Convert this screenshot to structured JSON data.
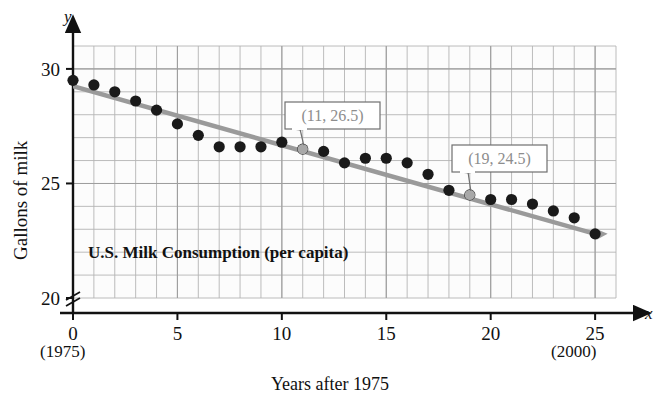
{
  "chart_data": {
    "type": "scatter",
    "title": "U.S. Milk Consumption (per capita)",
    "xlabel": "Years after 1975",
    "ylabel": "Gallons of milk",
    "xlim": [
      0,
      26
    ],
    "ylim": [
      20,
      31
    ],
    "grid": true,
    "y_axis_break": true,
    "legend": "none",
    "x_ticks": [
      "0",
      "5",
      "10",
      "15",
      "20",
      "25"
    ],
    "x_tick_values": [
      0,
      5,
      10,
      15,
      20,
      25
    ],
    "y_ticks": [
      "20",
      "25",
      "30"
    ],
    "y_tick_values": [
      20,
      25,
      30
    ],
    "x_axis_var": "x",
    "y_axis_var": "y",
    "x_start_year_label": "(1975)",
    "x_end_year_label": "(2000)",
    "x": [
      0,
      1,
      2,
      3,
      4,
      5,
      6,
      7,
      8,
      9,
      10,
      11,
      12,
      13,
      14,
      15,
      16,
      17,
      18,
      19,
      20,
      21,
      22,
      23,
      24,
      25
    ],
    "values": [
      29.5,
      29.3,
      29.0,
      28.6,
      28.2,
      27.6,
      27.1,
      26.6,
      26.6,
      26.6,
      26.8,
      26.5,
      26.4,
      25.9,
      26.1,
      26.1,
      25.9,
      25.4,
      24.7,
      24.5,
      24.3,
      24.3,
      24.1,
      23.8,
      23.5,
      22.8
    ],
    "series": [
      {
        "name": "U.S. milk consumption per capita (gallons)",
        "values": [
          29.5,
          29.3,
          29.0,
          28.6,
          28.2,
          27.6,
          27.1,
          26.6,
          26.6,
          26.6,
          26.8,
          26.5,
          26.4,
          25.9,
          26.1,
          26.1,
          25.9,
          25.4,
          24.7,
          24.5,
          24.3,
          24.3,
          24.1,
          23.8,
          23.5,
          22.8
        ]
      }
    ],
    "trend_line": {
      "type": "line",
      "point_1": [
        11,
        26.5
      ],
      "point_2": [
        19,
        24.5
      ],
      "slope": -0.25,
      "intercept": 29.25,
      "x_from": 0,
      "x_to": 25.6,
      "color": "#9a9a9a"
    },
    "annotations": [
      {
        "label": "(11, 26.5)",
        "x": 11,
        "y": 26.5
      },
      {
        "label": "(19, 24.5)",
        "x": 19,
        "y": 24.5
      }
    ],
    "colors": {
      "point": "#1a1a1a",
      "trend": "#9a9a9a",
      "grid_major": "#b4b4b4",
      "grid_minor": "#dcdcdc",
      "axis": "#111111",
      "callout_text": "#8d8d8d",
      "callout_border": "#6f6f6f"
    }
  }
}
